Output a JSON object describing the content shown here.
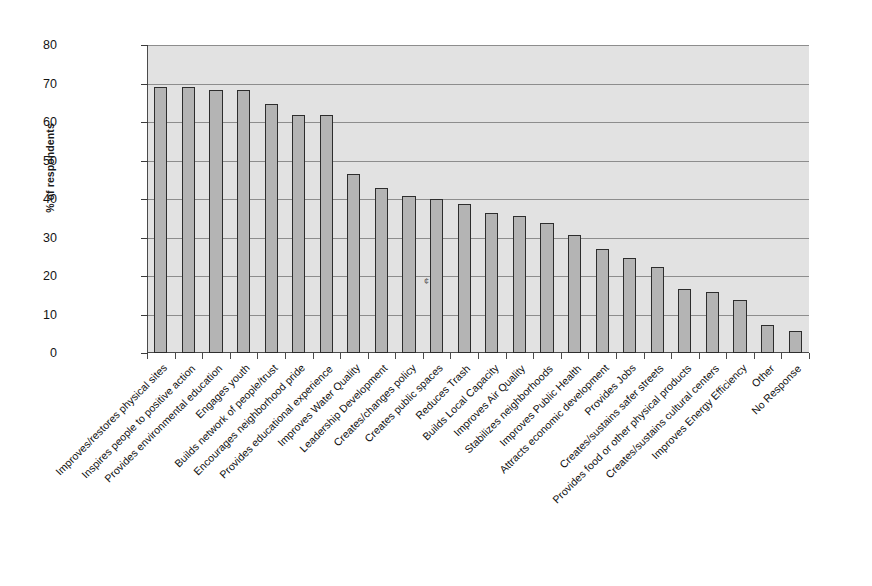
{
  "chart_data": {
    "type": "bar",
    "title": "",
    "subtitle": "",
    "xlabel": "",
    "ylabel": "% of respondents",
    "ylim": [
      0,
      80
    ],
    "yticks": [
      0,
      10,
      20,
      30,
      40,
      50,
      60,
      70,
      80
    ],
    "grid": true,
    "legend": false,
    "orientation": "vertical",
    "bar_color": "#b4b4b4",
    "bar_edge_color": "#2d2d2d",
    "plot_background": "#e2e2e2",
    "categories": [
      "Improves/restores physical sites",
      "Inspires people to positive action",
      "Provides environmental education",
      "Engages youth",
      "Builds network of people/trust",
      "Encourages neighborhood pride",
      "Provides educational experience",
      "Improves Water Quality",
      "Leadership Development",
      "Creates/changes policy",
      "Creates public spaces",
      "Reduces Trash",
      "Builds Local Capacity",
      "Improves Air Quality",
      "Stabilizes neighborhoods",
      "Improves Public Health",
      "Attracts economic development",
      "Provides Jobs",
      "Creates/sustains safer streets",
      "Provides food or other physical products",
      "Creates/sustains cultural centers",
      "Improves Energy Efficiency",
      "Other",
      "No Response"
    ],
    "values": [
      69.2,
      69.2,
      68.3,
      68.3,
      64.7,
      61.8,
      61.9,
      46.4,
      42.8,
      40.7,
      40.1,
      38.6,
      36.3,
      35.7,
      33.7,
      30.7,
      27.0,
      24.7,
      22.4,
      16.5,
      15.8,
      13.9,
      7.3,
      5.6
    ]
  },
  "artifacts": {
    "scan_speck": "¢"
  }
}
